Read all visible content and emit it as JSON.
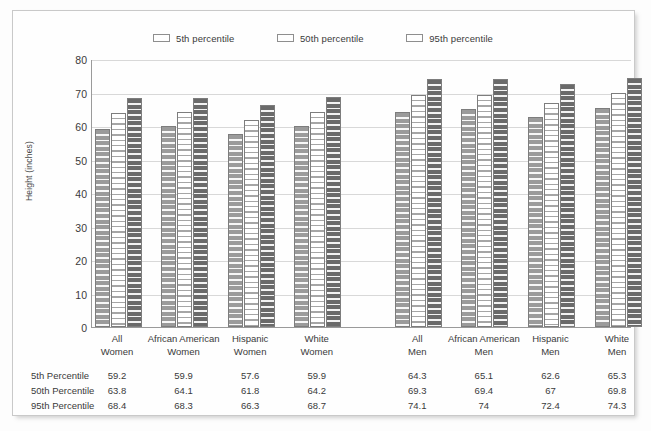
{
  "chart_data": {
    "type": "bar",
    "title": "",
    "xlabel": "",
    "ylabel": "Height (inches)",
    "ylim": [
      0,
      80
    ],
    "yticks": [
      0,
      10,
      20,
      30,
      40,
      50,
      60,
      70,
      80
    ],
    "grid": true,
    "legend_position": "top-center",
    "categories": [
      "All Women",
      "African American Women",
      "Hispanic Women",
      "White Women",
      "All Men",
      "African American Men",
      "Hispanic Men",
      "White Men"
    ],
    "category_lines": [
      [
        "All",
        "Women"
      ],
      [
        "African American",
        "Women"
      ],
      [
        "Hispanic",
        "Women"
      ],
      [
        "White",
        "Women"
      ],
      [
        "All",
        "Men"
      ],
      [
        "African American",
        "Men"
      ],
      [
        "Hispanic",
        "Men"
      ],
      [
        "White",
        "Men"
      ]
    ],
    "series": [
      {
        "name": "5th percentile",
        "color": "#9b9b9b",
        "values": [
          59.2,
          59.9,
          57.6,
          59.9,
          64.3,
          65.1,
          62.6,
          65.3
        ]
      },
      {
        "name": "50th percentile",
        "color": "#ffffff",
        "values": [
          63.8,
          64.1,
          61.8,
          64.2,
          69.3,
          69.4,
          67.0,
          69.8
        ]
      },
      {
        "name": "95th percentile",
        "color": "#6a6a6a",
        "values": [
          68.4,
          68.3,
          66.3,
          68.7,
          74.1,
          74.0,
          72.4,
          74.3
        ]
      }
    ]
  },
  "legend": {
    "items": [
      {
        "label": "5th percentile",
        "swatch": "p5"
      },
      {
        "label": "50th percentile",
        "swatch": "p50"
      },
      {
        "label": "95th percentile",
        "swatch": "p95"
      }
    ]
  },
  "axis": {
    "y_title": "Height (inches)",
    "y_ticks": [
      "80",
      "70",
      "60",
      "50",
      "40",
      "30",
      "20",
      "10",
      "0"
    ]
  },
  "table": {
    "rows": [
      {
        "label": "5th Percentile",
        "values": [
          "59.2",
          "59.9",
          "57.6",
          "59.9",
          "64.3",
          "65.1",
          "62.6",
          "65.3"
        ]
      },
      {
        "label": "50th Percentile",
        "values": [
          "63.8",
          "64.1",
          "61.8",
          "64.2",
          "69.3",
          "69.4",
          "67",
          "69.8"
        ]
      },
      {
        "label": "95th Percentile",
        "values": [
          "68.4",
          "68.3",
          "66.3",
          "68.7",
          "74.1",
          "74",
          "72.4",
          "74.3"
        ]
      }
    ]
  },
  "colors": {
    "p5": "#9b9b9b",
    "p50": "#ffffff",
    "p95": "#6a6a6a",
    "gridline": "#d8d8d8",
    "axis": "#9a9a9a",
    "text": "#3a3a3a"
  }
}
